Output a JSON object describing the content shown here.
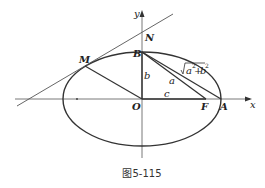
{
  "figure": {
    "caption": "图5-115",
    "axes": {
      "x_label": "x",
      "y_label": "y"
    },
    "points": {
      "O": "O",
      "B": "B",
      "N": "N",
      "M": "M",
      "F": "F",
      "A": "A"
    },
    "segment_labels": {
      "OB": "b",
      "OF": "c",
      "BF": "a",
      "BA": "√(a²+b²)"
    },
    "sqrt_label": {
      "base_a": "a",
      "sup_a": "2",
      "plus": "+",
      "base_b": "b",
      "sup_b": "2"
    },
    "colors": {
      "stroke": "#333333",
      "thin": "#555555",
      "text": "#222222"
    }
  }
}
